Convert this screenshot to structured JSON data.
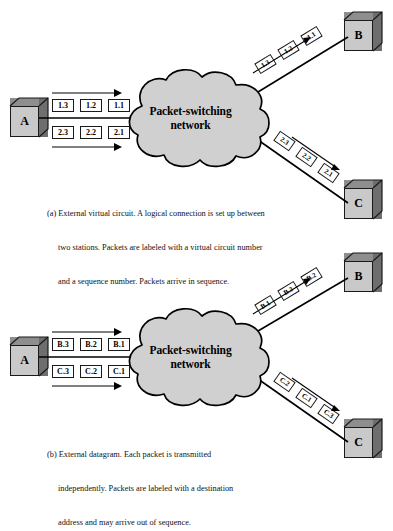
{
  "figure": {
    "cloud_label_line1": "Packet-switching",
    "cloud_label_line2": "network",
    "colors": {
      "cloud_fill": "#d0d0d0",
      "cloud_stroke": "#000000",
      "node_face": "#c9c9c9",
      "node_top": "#8e8e8e",
      "node_side": "#6e6e6e",
      "packet_fill": "#ffffff",
      "line": "#000000",
      "text": "#111111"
    }
  },
  "panel_a": {
    "id": "a",
    "nodes": [
      {
        "key": "A",
        "label": "A"
      },
      {
        "key": "B",
        "label": "B"
      },
      {
        "key": "C",
        "label": "C"
      }
    ],
    "cloud": {
      "line1": "Packet-switching",
      "line2": "network"
    },
    "source_streams": [
      {
        "name": "stream-1",
        "packets": [
          "1.3",
          "1.2",
          "1.1"
        ]
      },
      {
        "name": "stream-2",
        "packets": [
          "2.3",
          "2.2",
          "2.1"
        ]
      }
    ],
    "branch_to_b": {
      "packets": [
        "1.3",
        "1.2",
        "1.1"
      ]
    },
    "branch_to_c": {
      "packets": [
        "2.3",
        "2.2",
        "2.1"
      ]
    },
    "caption": {
      "line1": "(a) External virtual circuit. A logical connection is set up between",
      "line2": "two stations. Packets are labeled with a virtual circuit number",
      "line3": "and a sequence number. Packets arrive in sequence."
    }
  },
  "panel_b": {
    "id": "b",
    "nodes": [
      {
        "key": "A",
        "label": "A"
      },
      {
        "key": "B",
        "label": "B"
      },
      {
        "key": "C",
        "label": "C"
      }
    ],
    "cloud": {
      "line1": "Packet-switching",
      "line2": "network"
    },
    "source_streams": [
      {
        "name": "stream-b",
        "packets": [
          "B.3",
          "B.2",
          "B.1"
        ]
      },
      {
        "name": "stream-c",
        "packets": [
          "C.3",
          "C.2",
          "C.1"
        ]
      }
    ],
    "branch_to_b": {
      "packets": [
        "B.1",
        "B.3",
        "B.2"
      ]
    },
    "branch_to_c": {
      "packets": [
        "C.2",
        "C.1",
        "C.3"
      ]
    },
    "caption": {
      "line1": "(b) External datagram. Each packet is transmitted",
      "line2": "independently. Packets are labeled with a destination",
      "line3": "address and may arrive out of sequence."
    }
  }
}
